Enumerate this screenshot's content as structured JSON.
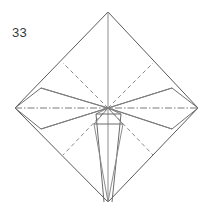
{
  "figure": {
    "step_number": "33",
    "background_color": "#ffffff",
    "line_colors": {
      "outline": "#5a5a5a",
      "mountain_solid": "#6e6e6e",
      "valley_dashed": "#8a8a8a",
      "axis_dashdot": "#7a7a7a",
      "spike": "#6a6a6a"
    },
    "canvas": {
      "width": 215,
      "height": 216
    }
  },
  "geometry": {
    "vertices": {
      "top_apex": {
        "x": 108,
        "y": 12
      },
      "bottom_apex": {
        "x": 108,
        "y": 202
      },
      "left_vertex": {
        "x": 15,
        "y": 108
      },
      "right_vertex": {
        "x": 198,
        "y": 108
      },
      "center": {
        "x": 108,
        "y": 108
      },
      "left_wing_upper": {
        "x": 41,
        "y": 88
      },
      "left_wing_lower": {
        "x": 41,
        "y": 129
      },
      "right_wing_upper": {
        "x": 172,
        "y": 88
      },
      "right_wing_lower": {
        "x": 172,
        "y": 129
      },
      "upper_left_dash_edge": {
        "x": 63,
        "y": 63
      },
      "upper_right_dash_edge": {
        "x": 153,
        "y": 63
      },
      "lower_left_dash_edge": {
        "x": 63,
        "y": 155
      },
      "lower_right_dash_edge": {
        "x": 153,
        "y": 155
      },
      "trapezoid_left_top": {
        "x": 96,
        "y": 114
      },
      "trapezoid_right_top": {
        "x": 121,
        "y": 114
      },
      "trapezoid_left_bottom": {
        "x": 94,
        "y": 124
      },
      "trapezoid_right_bottom": {
        "x": 123,
        "y": 124
      }
    },
    "outline_path": "M 108 12 L 198 108 L 108 202 L 15 108 Z",
    "labels": {
      "outline": "diamond-outline",
      "vertical_axis": "vertical-center-line",
      "horizontal_axis": "horizontal-center-dashdot-line"
    }
  },
  "legend": {
    "solid_line": "cut or edge / mountain fold",
    "dashed_line": "valley fold",
    "dash_dot_line": "center axis line"
  }
}
